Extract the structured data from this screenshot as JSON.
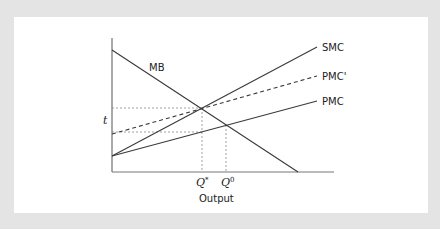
{
  "diagram": {
    "x_axis_label": "Output",
    "y_axis_tick_label": "t",
    "quantity_labels": {
      "q_star": "Q*",
      "q_star_base": "Q",
      "q_star_sup": "*",
      "q_zero_base": "Q",
      "q_zero_sup": "0"
    },
    "curves": [
      {
        "id": "MB",
        "label": "MB",
        "style": "solid",
        "from": [
          112,
          50
        ],
        "to": [
          298,
          172
        ]
      },
      {
        "id": "SMC",
        "label": "SMC",
        "style": "solid",
        "from": [
          112,
          156
        ],
        "to": [
          317,
          47
        ]
      },
      {
        "id": "PMC_prime",
        "label": "PMC'",
        "style": "dashed",
        "from": [
          112,
          134
        ],
        "to": [
          317,
          76
        ]
      },
      {
        "id": "PMC",
        "label": "PMC",
        "style": "solid",
        "from": [
          112,
          156
        ],
        "to": [
          317,
          101
        ]
      }
    ],
    "colors": {
      "line": "#3a3a3a",
      "guide": "#8a8a8a",
      "border": "#e4e4e4",
      "panel": "#ffffff"
    }
  }
}
